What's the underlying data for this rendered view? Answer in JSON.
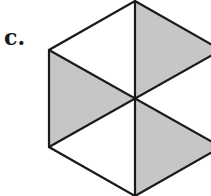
{
  "figure": {
    "label": "c.",
    "shape": "regular hexagon divided into 6 triangles",
    "shaded_triangles": 3,
    "total_triangles": 6,
    "colors": {
      "shade": "#c6c6c6",
      "stroke": "#1a1a1a",
      "background": "#ffffff"
    }
  }
}
